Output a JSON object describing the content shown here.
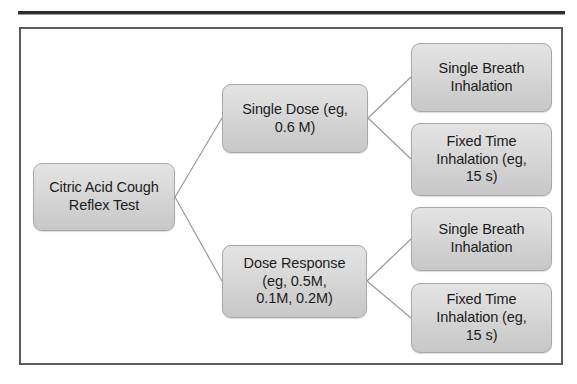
{
  "figure": {
    "type": "flowchart",
    "orientation": "left-to-right",
    "frame_border_color": "#5c5c5c",
    "node_fill_color": "#d6d6d6",
    "node_border_color": "#a8a8a8",
    "connector_color": "#9a9a9a",
    "text_color": "#1c1c1c"
  },
  "nodes": {
    "root": {
      "id": "citric-acid-cough-reflex-test",
      "label": "Citric Acid Cough\nReflex Test"
    },
    "branches": [
      {
        "id": "single-dose",
        "label": "Single Dose (eg,\n0.6 M)"
      },
      {
        "id": "dose-response",
        "label": "Dose Response\n(eg, 0.5M,\n0.1M, 0.2M)"
      }
    ],
    "leaves": [
      {
        "id": "single-breath-inhalation-top",
        "label": "Single Breath\nInhalation",
        "parent": "single-dose"
      },
      {
        "id": "fixed-time-inhalation-top",
        "label": "Fixed Time\nInhalation (eg,\n15 s)",
        "parent": "single-dose"
      },
      {
        "id": "single-breath-inhalation-bottom",
        "label": "Single Breath\nInhalation",
        "parent": "dose-response"
      },
      {
        "id": "fixed-time-inhalation-bottom",
        "label": "Fixed Time\nInhalation (eg,\n15 s)",
        "parent": "dose-response"
      }
    ]
  }
}
